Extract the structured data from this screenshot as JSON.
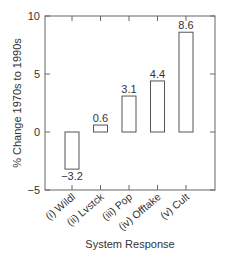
{
  "chart_data": {
    "type": "bar",
    "title": "",
    "xlabel": "System Response",
    "ylabel": "% Change 1970s to 1990s",
    "categories": [
      "(i) Wildl",
      "(ii) Lvstck",
      "(iii) Pop",
      "(iv) Offtake",
      "(v) Cult"
    ],
    "values": [
      -3.2,
      0.6,
      3.1,
      4.4,
      8.6
    ],
    "value_labels": [
      "−3.2",
      "0.6",
      "3.1",
      "4.4",
      "8.6"
    ],
    "ylim": [
      -5,
      10
    ],
    "yticks": [
      -5,
      0,
      5,
      10
    ],
    "ytick_labels": [
      "−5",
      "0",
      "5",
      "10"
    ],
    "grid": false,
    "legend": null,
    "bar_fill": "#ffffff",
    "bar_stroke": "#555555"
  }
}
